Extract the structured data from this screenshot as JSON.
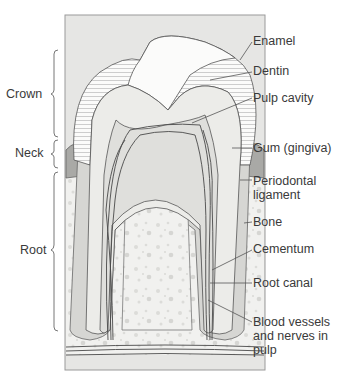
{
  "regions": [
    {
      "id": "crown",
      "label": "Crown"
    },
    {
      "id": "neck",
      "label": "Neck"
    },
    {
      "id": "root",
      "label": "Root"
    }
  ],
  "structures": [
    {
      "id": "enamel",
      "label": "Enamel"
    },
    {
      "id": "dentin",
      "label": "Dentin"
    },
    {
      "id": "pulp-cavity",
      "label": "Pulp cavity"
    },
    {
      "id": "gum",
      "label": "Gum (gingiva)"
    },
    {
      "id": "periodontal-ligament",
      "label": "Periodontal ligament"
    },
    {
      "id": "bone",
      "label": "Bone"
    },
    {
      "id": "cementum",
      "label": "Cementum"
    },
    {
      "id": "root-canal",
      "label": "Root canal"
    },
    {
      "id": "blood-vessels",
      "label": "Blood vessels and nerves in pulp"
    }
  ],
  "colors": {
    "panel_bg": "#e6e6e4",
    "panel_border": "#9a9a9a",
    "enamel_fill": "#fbfbfa",
    "dentin_fill": "#ecece9",
    "root_fill": "#d6d6d3",
    "gum_fill": "#a9a9a6",
    "bone_fill": "#f1f1ef",
    "bone_speckle": "#d9d9d6",
    "line": "#555555",
    "vessel": "#4a4a4a"
  }
}
